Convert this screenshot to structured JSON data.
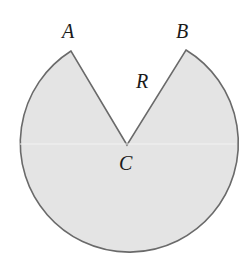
{
  "diagram": {
    "type": "circular sector with wedge removed",
    "colors": {
      "fill": "#e4e4e4",
      "stroke": "#6a6a6a",
      "label": "#1a1a1a",
      "background": "#ffffff"
    },
    "circle": {
      "cx": 128,
      "cy": 145,
      "r": 109
    },
    "points": {
      "A": {
        "label": "A",
        "x": 71,
        "y": 51
      },
      "B": {
        "label": "B",
        "x": 186,
        "y": 50
      },
      "C": {
        "label": "C",
        "x": 127,
        "y": 145
      }
    },
    "region_label": {
      "label": "R",
      "x": 142,
      "y": 88
    },
    "labels": {
      "A": "A",
      "B": "B",
      "C": "C",
      "R": "R"
    }
  }
}
